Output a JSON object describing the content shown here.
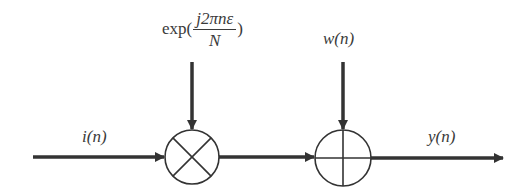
{
  "diagram": {
    "type": "signal-flow block diagram",
    "colors": {
      "line": "#333333",
      "text": "#3a3a3a",
      "background": "#ffffff"
    },
    "labels": {
      "input": "i(n)",
      "output": "y(n)",
      "noise": "w(n)",
      "exp_prefix": "exp(",
      "exp_numerator": "j2πnε",
      "exp_denominator": "N",
      "exp_suffix": ")"
    },
    "nodes": [
      {
        "id": "multiplier",
        "symbol": "⊗",
        "description": "multiplier (mixer)"
      },
      {
        "id": "adder",
        "symbol": "⊕",
        "description": "summing junction"
      }
    ],
    "edges": [
      {
        "from": "input i(n)",
        "to": "multiplier"
      },
      {
        "from": "exp(j2πnε/N)",
        "to": "multiplier"
      },
      {
        "from": "multiplier",
        "to": "adder"
      },
      {
        "from": "w(n)",
        "to": "adder"
      },
      {
        "from": "adder",
        "to": "output y(n)"
      }
    ]
  }
}
